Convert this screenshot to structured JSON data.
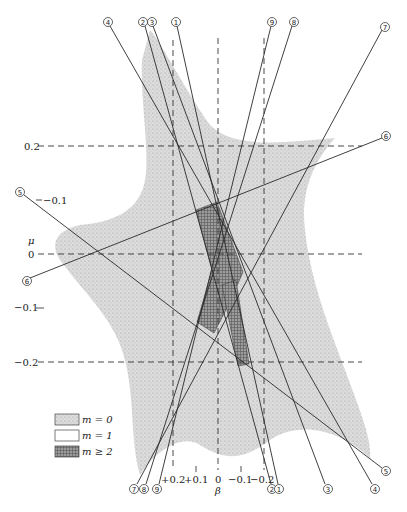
{
  "figure": {
    "title": "",
    "axes": {
      "horizontal": {
        "symbol": "β",
        "ticks": [
          {
            "label": "+0.2",
            "x": 173
          },
          {
            "label": "+0.1",
            "x": 196
          },
          {
            "label": "0",
            "x": 218
          },
          {
            "label": "−0.1",
            "x": 241
          },
          {
            "label": "−0.2",
            "x": 264
          }
        ]
      },
      "vertical": {
        "symbol": "μ",
        "ticks": [
          {
            "label": "0.2",
            "y": 146
          },
          {
            "label": "0.1",
            "y": 200
          },
          {
            "label": "0",
            "y": 254
          },
          {
            "label": "−0.1",
            "y": 307
          },
          {
            "label": "−0.2",
            "y": 362
          }
        ]
      }
    },
    "line_labels": [
      {
        "id": "1",
        "glyph": "①"
      },
      {
        "id": "2",
        "glyph": "②"
      },
      {
        "id": "3",
        "glyph": "③"
      },
      {
        "id": "4",
        "glyph": "④"
      },
      {
        "id": "5",
        "glyph": "⑤"
      },
      {
        "id": "6",
        "glyph": "⑥"
      },
      {
        "id": "7",
        "glyph": "⑦"
      },
      {
        "id": "8",
        "glyph": "⑧"
      },
      {
        "id": "9",
        "glyph": "⑨"
      }
    ],
    "legend": {
      "items": [
        {
          "label": "m = 0",
          "fill": "#c8c8c8",
          "pattern": "stipple"
        },
        {
          "label": "m = 1",
          "fill": "#ffffff",
          "pattern": "none"
        },
        {
          "label": "m ≥ 2",
          "fill": "#8a8a8a",
          "pattern": "crosshatch"
        }
      ]
    },
    "colors": {
      "stipple": "#cfcfcf",
      "dense": "#8e8e8e",
      "line": "#2a2a2a",
      "dashed": "#333333"
    }
  }
}
